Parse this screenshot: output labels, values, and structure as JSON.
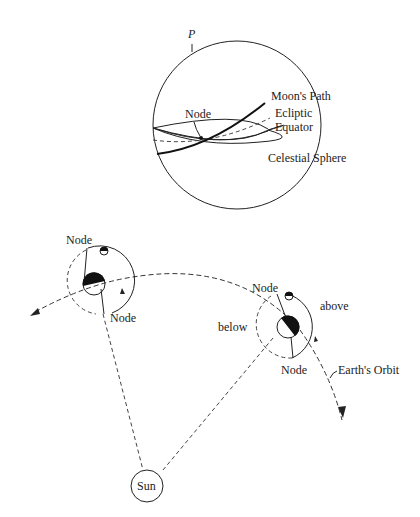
{
  "sphere": {
    "pole_label": "P",
    "node_label": "Node",
    "moons_path_label": "Moon's Path",
    "ecliptic_label": "Ecliptic",
    "equator_label": "Equator",
    "sphere_label": "Celestial Sphere"
  },
  "orbit": {
    "left_system": {
      "node_top_label": "Node",
      "node_bottom_label": "Node"
    },
    "right_system": {
      "node_top_label": "Node",
      "node_bottom_label": "Node",
      "above_label": "above",
      "below_label": "below"
    },
    "earth_orbit_label": "Earth's Orbit",
    "sun_label": "Sun"
  }
}
